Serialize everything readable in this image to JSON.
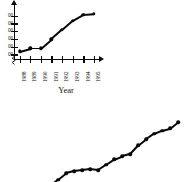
{
  "figure": {
    "background_color": "#ffffff",
    "ink_color": "#0a0a0a"
  },
  "chart_data": [
    {
      "id": "top",
      "type": "line",
      "title": "",
      "subtitle": "",
      "xlabel": "Year",
      "ylabel": "",
      "categories": [
        "1988",
        "1989",
        "1990",
        "1991",
        "1992",
        "1993",
        "1994",
        "1995"
      ],
      "x": [
        1988,
        1989,
        1990,
        1991,
        1992,
        1993,
        1994,
        1995
      ],
      "values": [
        1100,
        1150,
        1150,
        1300,
        1450,
        1600,
        1700,
        1710
      ],
      "ytick_labels": [
        "00",
        "00",
        "00",
        "00",
        "00",
        "00"
      ],
      "ytick_note": "y-axis tick labels are clipped by the left edge of the image; only trailing digits are legible",
      "ylim": [
        1000,
        1800
      ],
      "xlim": [
        1987.5,
        1995.8
      ],
      "grid": false,
      "legend": null,
      "legend_position": "none",
      "markers": "filled-circle",
      "axis_break": true,
      "axis_break_symbol": "zigzag-at-origin",
      "xtick_label_rotation": -90,
      "arrow_heads": [
        "y-axis-top",
        "x-axis-right"
      ]
    },
    {
      "id": "bottom",
      "type": "line",
      "title": "",
      "subtitle": "",
      "xlabel": "",
      "ylabel": "",
      "note": "second chart is cropped by the image frame; axes not visible",
      "x": [
        1,
        2,
        3,
        4,
        5,
        6,
        7,
        8,
        9,
        10,
        11,
        12,
        13,
        14,
        15,
        16,
        17
      ],
      "values": [
        2,
        8,
        14,
        16,
        17,
        18,
        17,
        22,
        27,
        30,
        32,
        40,
        46,
        51,
        54,
        56,
        62
      ],
      "grid": false,
      "legend": null,
      "legend_position": "none",
      "markers": "filled-circle"
    }
  ]
}
